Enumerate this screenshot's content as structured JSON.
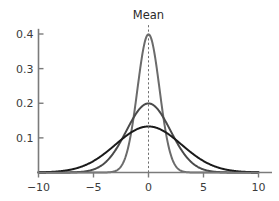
{
  "chart_data": {
    "type": "line",
    "title": "",
    "subtitle": "",
    "xlabel": "",
    "ylabel": "",
    "xlim": [
      -10.8,
      10.8
    ],
    "ylim": [
      0,
      0.425
    ],
    "grid": false,
    "legend_position": "none",
    "x_ticks": [
      -10,
      -5,
      0,
      5,
      10
    ],
    "x_tick_labels": [
      "−10",
      "−5",
      "0",
      "5",
      "10"
    ],
    "y_ticks": [
      0.1,
      0.2,
      0.3,
      0.4
    ],
    "y_tick_labels": [
      "0.1",
      "0.2",
      "0.3",
      "0.4"
    ],
    "annotations": [
      {
        "text": "Mean",
        "x": 0,
        "y": 0.42,
        "style": "dashed-vertical-line"
      }
    ],
    "series": [
      {
        "name": "sigma-1",
        "distribution": "normal",
        "mean": 0,
        "sigma": 1,
        "peak": 0.4,
        "color": "#6b6b6b",
        "stroke_width": 2.0,
        "x": [
          -10,
          -9,
          -8,
          -7,
          -6,
          -5,
          -4,
          -3,
          -2,
          -1,
          0,
          1,
          2,
          3,
          4,
          5,
          6,
          7,
          8,
          9,
          10
        ],
        "values": [
          0.0,
          0.0,
          0.0,
          0.0,
          0.0,
          0.0,
          0.0001,
          0.0044,
          0.054,
          0.242,
          0.3989,
          0.242,
          0.054,
          0.0044,
          0.0001,
          0.0,
          0.0,
          0.0,
          0.0,
          0.0,
          0.0
        ]
      },
      {
        "name": "sigma-2",
        "distribution": "normal",
        "mean": 0,
        "sigma": 2,
        "peak": 0.2,
        "color": "#4a4a4a",
        "stroke_width": 2.0,
        "x": [
          -10,
          -9,
          -8,
          -7,
          -6,
          -5,
          -4,
          -3,
          -2,
          -1,
          0,
          1,
          2,
          3,
          4,
          5,
          6,
          7,
          8,
          9,
          10
        ],
        "values": [
          0.0001,
          0.0004,
          0.0027,
          0.0122,
          0.0432,
          0.1209,
          0.121,
          0.0648,
          0.121,
          0.176,
          0.1995,
          0.176,
          0.121,
          0.0648,
          0.027,
          0.0088,
          0.0022,
          0.0004,
          0.0001,
          0.0,
          0.0
        ]
      },
      {
        "name": "sigma-3",
        "distribution": "normal",
        "mean": 0,
        "sigma": 3,
        "peak": 0.1419,
        "color": "#1a1a1a",
        "stroke_width": 2.0,
        "x": [
          -10,
          -9,
          -8,
          -7,
          -6,
          -5,
          -4,
          -3,
          -2,
          -1,
          0,
          1,
          2,
          3,
          4,
          5,
          6,
          7,
          8,
          9,
          10
        ],
        "values": [
          0.0006,
          0.0018,
          0.0038,
          0.0076,
          0.018,
          0.0331,
          0.0547,
          0.0807,
          0.1065,
          0.1258,
          0.133,
          0.1258,
          0.1065,
          0.0807,
          0.0547,
          0.0331,
          0.018,
          0.0076,
          0.0038,
          0.0018,
          0.0006
        ]
      }
    ]
  },
  "colors": {
    "axis": "#7b7b7b",
    "tick_label": "#3b3b3b",
    "mean_line": "#6f6f6f",
    "background": "#ffffff"
  }
}
